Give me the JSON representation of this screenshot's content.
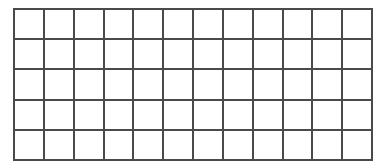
{
  "grid": {
    "rows": 5,
    "columns": 12,
    "line_color": "#4a4a4a",
    "cell_color": "#ffffff",
    "cells": []
  }
}
